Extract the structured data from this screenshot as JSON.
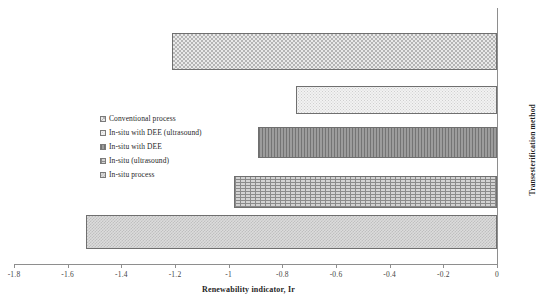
{
  "chart_data": {
    "type": "bar",
    "orientation": "horizontal",
    "title": "",
    "xlabel": "Renewability indicator, Ir",
    "ylabel": "Transesterification method",
    "xlim": [
      -1.8,
      0
    ],
    "xticks": [
      -1.8,
      -1.6,
      -1.4,
      -1.2,
      -1,
      -0.8,
      -0.6,
      -0.4,
      -0.2,
      0
    ],
    "xticklabels": [
      "-1.8",
      "-1.6",
      "-1.4",
      "-1.2",
      "-1",
      "-0.8",
      "-0.6",
      "-0.4",
      "-0.2",
      "0"
    ],
    "grid": false,
    "legend_position": "center-left-inside",
    "categories": [
      "Conventional process",
      "In-situ with DEE (ultrasound)",
      "In-situ with DEE",
      "In-situ (ultrasound)",
      "In-situ process"
    ],
    "values": [
      -1.21,
      -0.75,
      -0.89,
      -0.98,
      -1.53
    ],
    "bars": [
      {
        "label": "Conventional process",
        "value": -1.21,
        "pattern": "checker-fine"
      },
      {
        "label": "In-situ with DEE (ultrasound)",
        "value": -0.75,
        "pattern": "dots-light"
      },
      {
        "label": "In-situ with DEE",
        "value": -0.89,
        "pattern": "vstripe-dark"
      },
      {
        "label": "In-situ (ultrasound)",
        "value": -0.98,
        "pattern": "brick"
      },
      {
        "label": "In-situ process",
        "value": -1.53,
        "pattern": "weave"
      }
    ]
  },
  "legend": {
    "items": [
      {
        "label": "Conventional process",
        "pattern": "checker-fine"
      },
      {
        "label": "In-situ with DEE (ultrasound)",
        "pattern": "dots-light"
      },
      {
        "label": "In-situ with DEE",
        "pattern": "vstripe-dark"
      },
      {
        "label": "In-situ (ultrasound)",
        "pattern": "brick"
      },
      {
        "label": "In-situ process",
        "pattern": "weave"
      }
    ]
  },
  "axes": {
    "x_title": "Renewability indicator, Ir",
    "y_title": "Transesterification method"
  },
  "colors": {
    "axis": "#8e8e8e",
    "bar_outline": "#6f6f6f",
    "text": "#1f1f1f",
    "background": "#ffffff"
  }
}
